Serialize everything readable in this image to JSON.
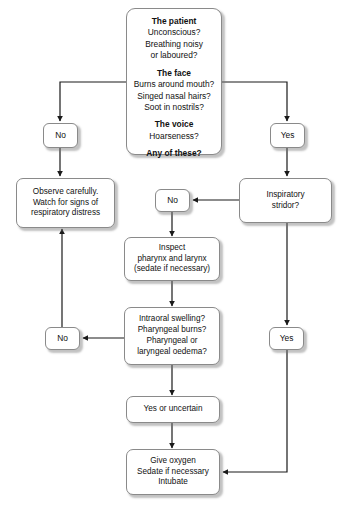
{
  "diagram": {
    "type": "flowchart",
    "colors": {
      "node_border": "#8a8a8a",
      "node_fill": "#ffffff",
      "connector": "#1a1a1a",
      "text": "#111111",
      "shadow": "rgba(120,120,120,0.45)"
    },
    "nodes": {
      "assessment": {
        "id": "assessment",
        "shape": "rounded-rect",
        "sections": [
          {
            "heading": "The patient",
            "lines": [
              "Unconscious?",
              "Breathing noisy",
              "or laboured?"
            ]
          },
          {
            "heading": "The face",
            "lines": [
              "Burns around mouth?",
              "Singed nasal hairs?",
              "Soot in nostrils?"
            ]
          },
          {
            "heading": "The voice",
            "lines": [
              "Hoarseness?"
            ]
          }
        ],
        "question": "Any of these?"
      },
      "no_top_left": {
        "id": "no_top_left",
        "label": "No",
        "shape": "rounded-rect"
      },
      "yes_top_right": {
        "id": "yes_top_right",
        "label": "Yes",
        "shape": "rounded-rect"
      },
      "observe": {
        "id": "observe",
        "shape": "rounded-rect",
        "lines": [
          "Observe carefully.",
          "Watch for signs of",
          "respiratory distress"
        ]
      },
      "stridor": {
        "id": "stridor",
        "shape": "rounded-rect",
        "lines": [
          "Inspiratory",
          "stridor?"
        ]
      },
      "no_stridor": {
        "id": "no_stridor",
        "label": "No",
        "shape": "rounded-rect"
      },
      "yes_stridor": {
        "id": "yes_stridor",
        "label": "Yes",
        "shape": "rounded-rect"
      },
      "inspect": {
        "id": "inspect",
        "shape": "rounded-rect",
        "lines": [
          "Inspect",
          "pharynx and larynx",
          "(sedate if necessary)"
        ]
      },
      "swelling": {
        "id": "swelling",
        "shape": "rounded-rect",
        "lines": [
          "Intraoral swelling?",
          "Pharyngeal burns?",
          "Pharyngeal or",
          "laryngeal oedema?"
        ]
      },
      "no_swelling": {
        "id": "no_swelling",
        "label": "No",
        "shape": "rounded-rect"
      },
      "yes_uncertain": {
        "id": "yes_uncertain",
        "shape": "rounded-rect",
        "lines": [
          "Yes or uncertain"
        ]
      },
      "treatment": {
        "id": "treatment",
        "shape": "rounded-rect",
        "lines": [
          "Give oxygen",
          "Sedate if necessary",
          "Intubate"
        ]
      }
    },
    "edges": [
      {
        "from": "assessment",
        "to": "no_top_left",
        "label": "No"
      },
      {
        "from": "assessment",
        "to": "yes_top_right",
        "label": "Yes"
      },
      {
        "from": "no_top_left",
        "to": "observe",
        "label": ""
      },
      {
        "from": "yes_top_right",
        "to": "stridor",
        "label": ""
      },
      {
        "from": "stridor",
        "to": "no_stridor",
        "label": "No"
      },
      {
        "from": "stridor",
        "to": "yes_stridor",
        "label": "Yes"
      },
      {
        "from": "no_stridor",
        "to": "inspect",
        "label": ""
      },
      {
        "from": "inspect",
        "to": "swelling",
        "label": ""
      },
      {
        "from": "swelling",
        "to": "no_swelling",
        "label": "No"
      },
      {
        "from": "no_swelling",
        "to": "observe",
        "label": ""
      },
      {
        "from": "swelling",
        "to": "yes_uncertain",
        "label": ""
      },
      {
        "from": "yes_uncertain",
        "to": "treatment",
        "label": ""
      },
      {
        "from": "yes_stridor",
        "to": "treatment",
        "label": ""
      }
    ]
  }
}
